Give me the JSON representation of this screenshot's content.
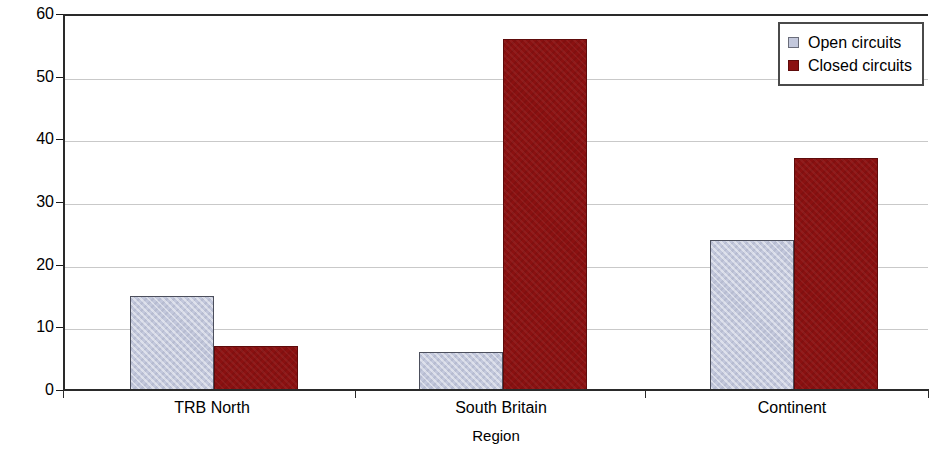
{
  "chart_data": {
    "type": "bar",
    "title": "",
    "xlabel": "Region",
    "ylabel": "Number of enclosures",
    "categories": [
      "TRB North",
      "South Britain",
      "Continent"
    ],
    "series": [
      {
        "name": "Open circuits",
        "color": "#c3c8dc",
        "values": [
          15,
          6,
          24
        ]
      },
      {
        "name": "Closed circuits",
        "color": "#8b1111",
        "values": [
          7,
          56,
          37
        ]
      }
    ],
    "ylim": [
      0,
      60
    ],
    "yticks": [
      0,
      10,
      20,
      30,
      40,
      50,
      60
    ],
    "ytick_labels": [
      "0",
      "10",
      "20",
      "30",
      "40",
      "50",
      "60"
    ],
    "grid": "horizontal",
    "legend_position": "top-right",
    "legend_entries": [
      "Open circuits",
      "Closed circuits"
    ]
  }
}
